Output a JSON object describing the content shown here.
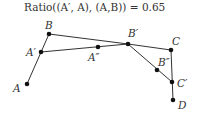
{
  "title": "Ratio((A′, A), (A,B)) = 0.65",
  "points": [
    {
      "id": "B",
      "label": "B",
      "x": 49,
      "y": 34,
      "lx": 45,
      "ly": 29
    },
    {
      "id": "A1",
      "label": "A′",
      "x": 41,
      "y": 52,
      "lx": 26,
      "ly": 56
    },
    {
      "id": "A",
      "label": "A",
      "x": 27,
      "y": 84,
      "lx": 13,
      "ly": 92
    },
    {
      "id": "A2",
      "label": "A″",
      "x": 98,
      "y": 47,
      "lx": 88,
      "ly": 61
    },
    {
      "id": "B1",
      "label": "B′",
      "x": 128,
      "y": 44,
      "lx": 128,
      "ly": 37
    },
    {
      "id": "C",
      "label": "C",
      "x": 171,
      "y": 50,
      "lx": 172,
      "ly": 45
    },
    {
      "id": "B2",
      "label": "B″",
      "x": 157,
      "y": 70,
      "lx": 158,
      "ly": 66
    },
    {
      "id": "C1",
      "label": "C′",
      "x": 172,
      "y": 82,
      "lx": 177,
      "ly": 87
    },
    {
      "id": "D",
      "label": "D",
      "x": 173,
      "y": 100,
      "lx": 178,
      "ly": 109
    }
  ],
  "segments": [
    [
      "A",
      "B"
    ],
    [
      "B",
      "B1"
    ],
    [
      "A1",
      "B1"
    ],
    [
      "B1",
      "C"
    ],
    [
      "C",
      "D"
    ],
    [
      "B1",
      "C1"
    ]
  ],
  "colors": {
    "line": "#333333",
    "point": "#111111",
    "text": "#333333"
  }
}
